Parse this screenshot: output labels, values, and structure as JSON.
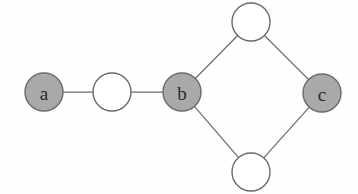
{
  "figure": {
    "width": 358,
    "height": 194,
    "background_color": "#fefefe"
  },
  "style": {
    "filled_node_fill": "#a9a9a9",
    "open_node_fill": "#ffffff",
    "node_stroke": "#6a6a6a",
    "edge_stroke": "#6f6f6f",
    "label_color": "#2b2b2b",
    "node_radius": 19,
    "node_stroke_width": 1.4,
    "edge_stroke_width": 1.25
  },
  "chart_data": {
    "type": "diagram",
    "subtype": "node-link-graph",
    "directed": false,
    "nodes": [
      {
        "id": "a",
        "label": "a",
        "filled": true,
        "cx": 44,
        "cy": 92,
        "r": 19
      },
      {
        "id": "n1",
        "label": "",
        "filled": false,
        "cx": 112,
        "cy": 92,
        "r": 19
      },
      {
        "id": "b",
        "label": "b",
        "filled": true,
        "cx": 182,
        "cy": 92,
        "r": 19
      },
      {
        "id": "t",
        "label": "",
        "filled": false,
        "cx": 251,
        "cy": 22,
        "r": 19
      },
      {
        "id": "bm",
        "label": "",
        "filled": false,
        "cx": 251,
        "cy": 172,
        "r": 19
      },
      {
        "id": "c",
        "label": "c",
        "filled": true,
        "cx": 322,
        "cy": 93,
        "r": 19
      }
    ],
    "edges": [
      {
        "source": "a",
        "target": "n1"
      },
      {
        "source": "n1",
        "target": "b"
      },
      {
        "source": "b",
        "target": "t"
      },
      {
        "source": "b",
        "target": "bm"
      },
      {
        "source": "t",
        "target": "c"
      },
      {
        "source": "bm",
        "target": "c"
      }
    ],
    "labelled_nodes": [
      "a",
      "b",
      "c"
    ],
    "unlabelled_node_count": 3,
    "node_count": 6,
    "edge_count": 6
  },
  "labels": {
    "a": "a",
    "b": "b",
    "c": "c"
  }
}
